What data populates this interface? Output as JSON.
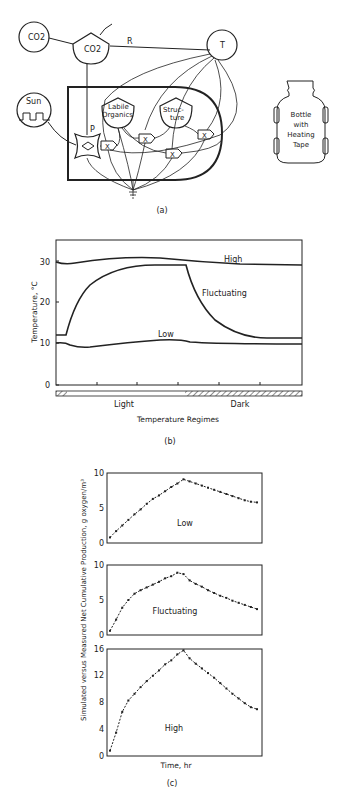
{
  "panel_a": {
    "caption": "(a)",
    "nodes": {
      "co2_source": "CO2",
      "co2_storage": "CO2",
      "temperature": "T",
      "sun": "Sun",
      "labile_organics_line1": "Labile",
      "labile_organics_line2": "Organics",
      "structure_line1": "Struc-",
      "structure_line2": "ture",
      "production": "P",
      "respiration": "R",
      "multiplier": "X"
    },
    "bottle": {
      "line1": "Bottle",
      "line2": "with",
      "line3": "Heating",
      "line4": "Tape"
    }
  },
  "panel_b": {
    "caption": "(b)",
    "ylabel": "Temperature, °C",
    "xlabel": "Temperature Regimes",
    "yticks": [
      "0",
      "10",
      "20",
      "30"
    ],
    "light_label": "Light",
    "dark_label": "Dark",
    "series_labels": {
      "high": "High",
      "fluctuating": "Fluctuating",
      "low": "Low"
    }
  },
  "panel_c": {
    "caption": "(c)",
    "ylabel": "Simulated versus Measured Net Cumulative Production, g oxygen/m³",
    "xlabel": "Time, hr",
    "low": {
      "label": "Low",
      "yticks": [
        "0",
        "5",
        "10"
      ]
    },
    "fluctuating": {
      "label": "Fluctuating",
      "yticks": [
        "0",
        "5",
        "10"
      ]
    },
    "high": {
      "label": "High",
      "yticks": [
        "0",
        "4",
        "8",
        "12",
        "16"
      ]
    }
  },
  "chart_data": [
    {
      "type": "line",
      "title": "(b) Temperature Regimes",
      "xlabel": "Temperature Regimes",
      "ylabel": "Temperature, °C",
      "ylim": [
        0,
        35
      ],
      "x": [
        0,
        0.05,
        0.15,
        0.3,
        0.45,
        0.52,
        0.53,
        0.6,
        0.7,
        0.8,
        0.9,
        1.0
      ],
      "x_note": "fraction of run; light period ~0.04–0.52, dark 0.52–1.0",
      "series": [
        {
          "name": "High",
          "values": [
            28.7,
            28.5,
            29.5,
            30.3,
            30.5,
            30.3,
            30.2,
            29.8,
            29.2,
            28.9,
            28.8,
            28.8
          ]
        },
        {
          "name": "Fluctuating",
          "values": [
            12,
            12,
            22.5,
            27.5,
            28.8,
            28.8,
            28.5,
            20,
            14,
            11.8,
            11.4,
            11.4
          ]
        },
        {
          "name": "Low",
          "values": [
            10.2,
            9.8,
            9.3,
            10.2,
            10.9,
            10.9,
            10.8,
            10.4,
            10.2,
            10.2,
            10.2,
            10.2
          ]
        }
      ],
      "grid": false
    },
    {
      "type": "line",
      "title": "(c) Low",
      "xlabel": "Time, hr",
      "ylabel": "g oxygen/m³",
      "ylim": [
        0,
        10
      ],
      "x": [
        0,
        1,
        2,
        3,
        4,
        5,
        6,
        7,
        8,
        9,
        10,
        11,
        12,
        13,
        14,
        15,
        16,
        17,
        18,
        19,
        20,
        21,
        22,
        23,
        24
      ],
      "values": [
        0.8,
        1.7,
        2.5,
        3.3,
        4.1,
        4.8,
        5.6,
        6.3,
        6.8,
        7.4,
        8.0,
        8.5,
        9.1,
        8.8,
        8.5,
        8.2,
        7.9,
        7.6,
        7.3,
        7.0,
        6.7,
        6.4,
        6.1,
        5.9,
        5.8
      ]
    },
    {
      "type": "line",
      "title": "(c) Fluctuating",
      "xlabel": "Time, hr",
      "ylabel": "g oxygen/m³",
      "ylim": [
        0,
        10
      ],
      "x": [
        0,
        1,
        2,
        3,
        4,
        5,
        6,
        7,
        8,
        9,
        10,
        11,
        12,
        13,
        14,
        15,
        16,
        17,
        18,
        19,
        20,
        21,
        22,
        23,
        24
      ],
      "values": [
        0.6,
        2.2,
        3.9,
        5.0,
        5.9,
        6.4,
        6.8,
        7.2,
        7.6,
        8.1,
        8.4,
        8.9,
        8.7,
        7.8,
        7.3,
        6.9,
        6.4,
        6.0,
        5.6,
        5.3,
        4.9,
        4.6,
        4.3,
        4.0,
        3.7
      ]
    },
    {
      "type": "line",
      "title": "(c) High",
      "xlabel": "Time, hr",
      "ylabel": "g oxygen/m³",
      "ylim": [
        0,
        16
      ],
      "x": [
        0,
        1,
        2,
        3,
        4,
        5,
        6,
        7,
        8,
        9,
        10,
        11,
        12,
        13,
        14,
        15,
        16,
        17,
        18,
        19,
        20,
        21,
        22,
        23,
        24
      ],
      "values": [
        0.8,
        3.5,
        6.6,
        8.3,
        9.3,
        10.3,
        11.2,
        12.0,
        12.8,
        13.7,
        14.3,
        15.2,
        15.8,
        14.6,
        13.8,
        13.1,
        12.4,
        11.7,
        10.9,
        10.1,
        9.3,
        8.6,
        7.9,
        7.3,
        7.0
      ]
    }
  ]
}
